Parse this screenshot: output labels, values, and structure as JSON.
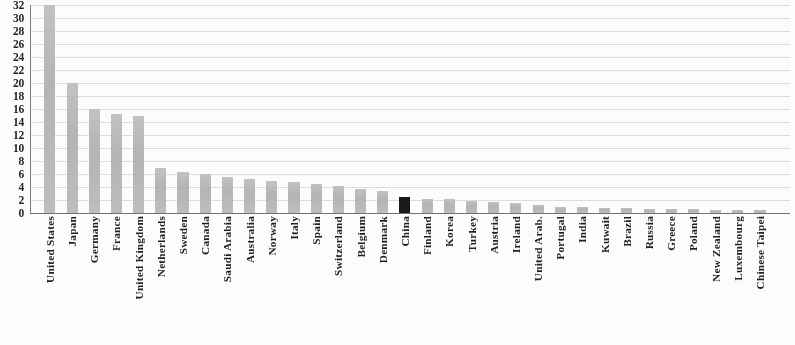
{
  "chart_data": {
    "type": "bar",
    "title": "",
    "subtitle": "",
    "xlabel": "",
    "ylabel": "",
    "ylim": [
      0,
      32
    ],
    "y_tick_step": 2,
    "y_ticks": [
      0,
      2,
      4,
      6,
      8,
      10,
      12,
      14,
      16,
      18,
      20,
      22,
      24,
      26,
      28,
      30,
      32
    ],
    "y_tick_labels": [
      "0",
      "2",
      "4",
      "6",
      "8",
      "10",
      "12",
      "14",
      "16",
      "18",
      "20",
      "22",
      "24",
      "26",
      "28",
      "30",
      "32"
    ],
    "grid": true,
    "grid_axis": "y",
    "legend": null,
    "legend_position": "none",
    "orientation": "vertical",
    "categories": [
      "United States",
      "Japan",
      "Germany",
      "France",
      "United Kingdom",
      "Netherlands",
      "Sweden",
      "Canada",
      "Saudi Arabia",
      "Australia",
      "Norway",
      "Italy",
      "Spain",
      "Switzerland",
      "Belgium",
      "Denmark",
      "China",
      "Finland",
      "Korea",
      "Turkey",
      "Austria",
      "Ireland",
      "United Arab.",
      "Portugal",
      "India",
      "Kuwait",
      "Brazil",
      "Russia",
      "Greece",
      "Poland",
      "New Zealand",
      "Luxembourg",
      "Chinese Taipei"
    ],
    "values": [
      32.0,
      20.0,
      16.0,
      15.3,
      15.0,
      7.0,
      6.3,
      6.0,
      5.6,
      5.3,
      4.9,
      4.7,
      4.4,
      4.1,
      3.7,
      3.4,
      2.4,
      2.2,
      2.1,
      1.9,
      1.7,
      1.5,
      1.2,
      0.9,
      0.85,
      0.8,
      0.7,
      0.65,
      0.6,
      0.55,
      0.5,
      0.45,
      0.4
    ],
    "highlight_index": 16,
    "highlight_category": "China",
    "colors": {
      "bar": "#b9b9b9",
      "bar_highlight": "#121212",
      "axis": "#6e6e6e",
      "grid": "#dddddd",
      "text": "#1a1a1a",
      "background": "#ffffff"
    }
  }
}
